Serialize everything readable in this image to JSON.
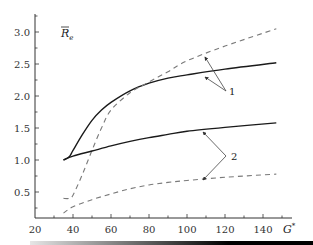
{
  "chart_data": {
    "type": "line",
    "title": "",
    "xlabel": "G*",
    "ylabel": "R̄e",
    "xlim": [
      20,
      150
    ],
    "ylim": [
      0.1,
      3.3
    ],
    "xticks": [
      20,
      40,
      60,
      80,
      100,
      120,
      140
    ],
    "xtick_labels": [
      "20",
      "40",
      "60",
      "80",
      "100",
      "120",
      "140"
    ],
    "yticks": [
      0.5,
      1.0,
      1.5,
      2.0,
      2.5,
      3.0
    ],
    "ytick_labels": [
      "0.5",
      "1.0",
      "1.5",
      "2.0",
      "2.5",
      "3.0"
    ],
    "grid": false,
    "legend": "none; curves labelled with callout numbers 1 and 2",
    "series": [
      {
        "name": "1 (solid)",
        "style": "solid",
        "group": "1",
        "x": [
          35,
          38,
          40,
          45,
          50,
          55,
          60,
          70,
          80,
          90,
          100,
          120,
          147
        ],
        "y": [
          1.0,
          1.05,
          1.15,
          1.4,
          1.62,
          1.78,
          1.9,
          2.08,
          2.2,
          2.28,
          2.33,
          2.42,
          2.52
        ]
      },
      {
        "name": "1 (dashed)",
        "style": "dashed",
        "group": "1",
        "x": [
          35,
          38,
          40,
          45,
          50,
          55,
          60,
          70,
          80,
          90,
          100,
          120,
          147
        ],
        "y": [
          0.4,
          0.4,
          0.45,
          0.78,
          1.15,
          1.5,
          1.78,
          2.05,
          2.22,
          2.38,
          2.55,
          2.78,
          3.05
        ]
      },
      {
        "name": "2 (solid)",
        "style": "solid",
        "group": "2",
        "x": [
          35,
          40,
          50,
          60,
          70,
          80,
          90,
          100,
          120,
          147
        ],
        "y": [
          1.0,
          1.06,
          1.14,
          1.22,
          1.29,
          1.35,
          1.4,
          1.45,
          1.51,
          1.58
        ]
      },
      {
        "name": "2 (dashed)",
        "style": "dashed",
        "group": "2",
        "x": [
          35,
          40,
          50,
          60,
          70,
          80,
          90,
          100,
          120,
          147
        ],
        "y": [
          0.17,
          0.27,
          0.38,
          0.47,
          0.55,
          0.61,
          0.65,
          0.68,
          0.73,
          0.78
        ]
      }
    ],
    "annotations": [
      {
        "text": "1",
        "points_to": [
          "1 (solid)",
          "1 (dashed)"
        ]
      },
      {
        "text": "2",
        "points_to": [
          "2 (solid)",
          "2 (dashed)"
        ]
      }
    ]
  },
  "labels": {
    "xlabel": "G",
    "xlabel_sup": "*",
    "ylabel": "R",
    "ylabel_sub": "e",
    "curve1": "1",
    "curve2": "2"
  }
}
